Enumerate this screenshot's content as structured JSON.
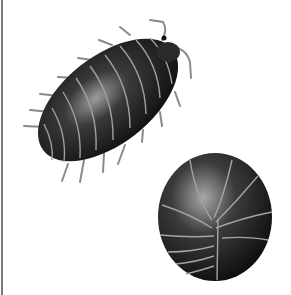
{
  "image": {
    "subject": "pillbug illustration",
    "figures": [
      {
        "name": "pillbug-extended",
        "pose": "walking, diagonal"
      },
      {
        "name": "pillbug-rolled",
        "pose": "rolled into ball"
      }
    ],
    "colors": {
      "background": "#ffffff",
      "body_dark": "#1a1a1a",
      "highlight": "#bdbdbd",
      "segment_line": "#9a9a9a",
      "legs": "#8a8a8a",
      "border": "#7a7a7a"
    }
  }
}
